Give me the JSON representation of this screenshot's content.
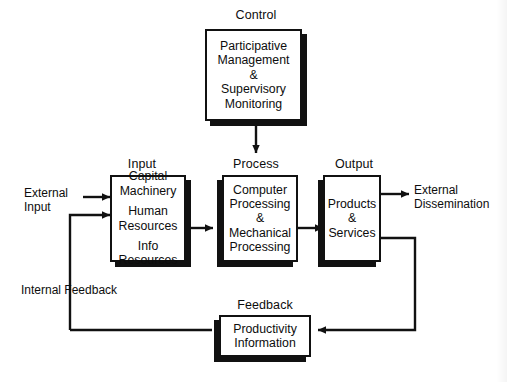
{
  "diagram": {
    "type": "block-flow-diagram",
    "colors": {
      "ink": "#111111",
      "paper": "#ffffff"
    }
  },
  "captions": {
    "control": "Control",
    "input": "Input",
    "process": "Process",
    "output": "Output",
    "feedback": "Feedback"
  },
  "nodes": {
    "control": {
      "lines": [
        "Participative",
        "Management",
        "&",
        "Supervisory",
        "Monitoring"
      ]
    },
    "input": {
      "groups": [
        [
          "Capital",
          "Machinery"
        ],
        [
          "Human",
          "Resources"
        ],
        [
          "Info",
          "Resources"
        ]
      ]
    },
    "process": {
      "lines": [
        "Computer",
        "Processing",
        "&",
        "Mechanical",
        "Processing"
      ]
    },
    "output": {
      "lines": [
        "Products",
        "&",
        "Services"
      ]
    },
    "feedback": {
      "lines": [
        "Productivity",
        "Information"
      ]
    }
  },
  "labels": {
    "external_input": [
      "External",
      "Input"
    ],
    "external_dissemination": [
      "External",
      "Dissemination"
    ],
    "internal_feedback": "Internal Feedback"
  },
  "flows": [
    {
      "from": "external-input",
      "to": "input",
      "arrow": "right"
    },
    {
      "from": "internal-feedback",
      "to": "input",
      "arrow": "right"
    },
    {
      "from": "input",
      "to": "process",
      "arrow": "right"
    },
    {
      "from": "control",
      "to": "process",
      "arrow": "down"
    },
    {
      "from": "process",
      "to": "output",
      "arrow": "right"
    },
    {
      "from": "output",
      "to": "external-dissemination",
      "arrow": "right"
    },
    {
      "from": "output",
      "to": "feedback",
      "arrow": "left"
    },
    {
      "from": "feedback",
      "to": "input",
      "arrow": "right"
    }
  ]
}
